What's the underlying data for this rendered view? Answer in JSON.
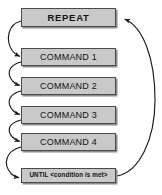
{
  "diagram": {
    "type": "flowchart",
    "colors": {
      "node_fill": "#c9c9c9",
      "node_border": "#4a4a4a",
      "node_shadow": "#8d8d8d",
      "arrow": "#1a1a1a",
      "background": "#ffffff",
      "text": "#121212"
    },
    "nodes": [
      {
        "id": "repeat",
        "label": "REPEAT"
      },
      {
        "id": "command1",
        "label": "COMMAND 1"
      },
      {
        "id": "command2",
        "label": "COMMAND 2"
      },
      {
        "id": "command3",
        "label": "COMMAND 3"
      },
      {
        "id": "command4",
        "label": "COMMAND 4"
      },
      {
        "id": "until",
        "label": "UNTIL <condition is met>"
      }
    ],
    "connectors": [
      {
        "id": "repeat-to-command1",
        "from": "repeat",
        "to": "command1",
        "style": "curved-hook-left"
      },
      {
        "id": "command1-to-command2",
        "from": "command1",
        "to": "command2",
        "style": "curved-hook-left"
      },
      {
        "id": "command2-to-command3",
        "from": "command2",
        "to": "command3",
        "style": "curved-hook-left"
      },
      {
        "id": "command3-to-command4",
        "from": "command3",
        "to": "command4",
        "style": "curved-hook-left"
      },
      {
        "id": "command4-to-until",
        "from": "command4",
        "to": "until",
        "style": "curved-hook-left"
      },
      {
        "id": "until-to-repeat",
        "from": "until",
        "to": "repeat",
        "style": "loop-back-arc-right"
      }
    ]
  }
}
